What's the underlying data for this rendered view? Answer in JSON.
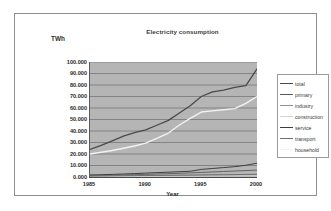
{
  "chart_data": {
    "type": "line",
    "title": "Electricity consumption",
    "xlabel": "Year",
    "ylabel": "TWh",
    "xlim": [
      1985,
      2000
    ],
    "ylim": [
      0,
      100
    ],
    "grid": true,
    "legend_position": "right",
    "x_tick_labels": [
      "1985",
      "1990",
      "1995",
      "2000"
    ],
    "x_ticks": [
      1985,
      1990,
      1995,
      2000
    ],
    "y_tick_labels": [
      "100.000",
      "90.000",
      "80.000",
      "70.000",
      "60.000",
      "50.000",
      "40.000",
      "30.000",
      "20.000",
      "10.000",
      "0.000"
    ],
    "y_ticks": [
      100,
      90,
      80,
      70,
      60,
      50,
      40,
      30,
      20,
      10,
      0
    ],
    "x": [
      1985,
      1986,
      1987,
      1988,
      1989,
      1990,
      1991,
      1992,
      1993,
      1994,
      1995,
      1996,
      1997,
      1998,
      1999,
      2000
    ],
    "series": [
      {
        "name": "total",
        "color": "#4a4a4a",
        "width": 1.3,
        "values": [
          24.0,
          27.5,
          31.5,
          35.5,
          38.5,
          41.0,
          45.0,
          49.0,
          55.5,
          62.0,
          70.0,
          74.0,
          75.5,
          78.0,
          79.5,
          94.0
        ]
      },
      {
        "name": "primary",
        "color": "#5a5a5a",
        "width": 0.9,
        "values": [
          1.2,
          1.4,
          1.6,
          1.8,
          2.0,
          2.3,
          2.6,
          2.9,
          3.2,
          3.6,
          4.0,
          4.4,
          4.8,
          5.2,
          5.6,
          6.0
        ]
      },
      {
        "name": "industry",
        "color": "#8f8f8f",
        "width": 0.9,
        "values": [
          0.5,
          0.6,
          0.7,
          0.8,
          0.9,
          1.0,
          1.1,
          1.2,
          1.3,
          1.4,
          1.5,
          1.6,
          1.7,
          1.8,
          1.9,
          2.0
        ]
      },
      {
        "name": "construction",
        "color": "#d4d4d4",
        "width": 0.9,
        "values": [
          0.3,
          0.35,
          0.4,
          0.45,
          0.5,
          0.55,
          0.6,
          0.65,
          0.7,
          0.75,
          0.8,
          0.85,
          0.9,
          0.95,
          1.0,
          1.1
        ]
      },
      {
        "name": "service",
        "color": "#3f3f3f",
        "width": 1.0,
        "values": [
          1.8,
          2.0,
          2.3,
          2.6,
          3.0,
          3.4,
          3.8,
          4.2,
          4.6,
          5.0,
          6.6,
          7.4,
          8.2,
          9.0,
          10.2,
          12.0
        ]
      },
      {
        "name": "transport",
        "color": "#707070",
        "width": 1.0,
        "values": [
          0.8,
          0.9,
          1.0,
          1.1,
          1.2,
          1.3,
          1.4,
          1.5,
          1.6,
          1.7,
          1.8,
          1.9,
          2.0,
          2.1,
          2.2,
          2.3
        ]
      },
      {
        "name": "household",
        "color": "#f2f2f2",
        "width": 1.4,
        "values": [
          20.0,
          21.5,
          23.0,
          25.0,
          27.0,
          29.5,
          33.5,
          38.0,
          45.0,
          51.0,
          56.5,
          57.5,
          58.5,
          59.5,
          64.0,
          70.0
        ]
      }
    ]
  },
  "legend": {
    "items": [
      {
        "label": "total"
      },
      {
        "label": "primary"
      },
      {
        "label": "industry"
      },
      {
        "label": "construction"
      },
      {
        "label": "service"
      },
      {
        "label": "transport"
      },
      {
        "label": "household"
      }
    ]
  }
}
